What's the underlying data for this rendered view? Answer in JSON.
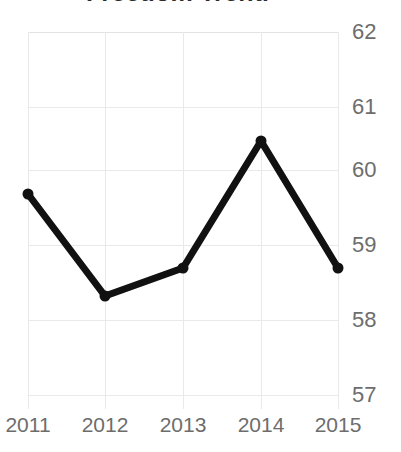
{
  "chart_data": {
    "type": "line",
    "title": "Freedom Trend",
    "xlabel": "",
    "ylabel": "",
    "categories": [
      "2011",
      "2012",
      "2013",
      "2014",
      "2015"
    ],
    "x": [
      2011,
      2012,
      2013,
      2014,
      2015
    ],
    "values": [
      59.68,
      58.32,
      58.69,
      60.39,
      58.69
    ],
    "series": [
      {
        "name": "Freedom",
        "values": [
          59.68,
          58.32,
          58.69,
          60.39,
          58.69
        ]
      }
    ],
    "ylim": [
      57,
      62
    ],
    "yticks": [
      62,
      61,
      60,
      59,
      58,
      57
    ],
    "ytick_labels": [
      "62",
      "61",
      "60",
      "59",
      "58",
      "57"
    ],
    "xticks": [
      "2011",
      "2012",
      "2013",
      "2014",
      "2015"
    ],
    "grid": true,
    "grid_axis": "both",
    "legend": false,
    "legend_position": "none",
    "y_axis_side": "right",
    "markers": true,
    "colors": {
      "line": "#111111",
      "marker": "#111111",
      "grid": "#e9e9e9",
      "tick_label": "#6d6d6d",
      "title": "#2b2b2b",
      "background": "#ffffff"
    }
  },
  "geometry": {
    "plot_left": 28,
    "plot_top": 32,
    "plot_width": 310,
    "plot_height": 363,
    "y_value_top": 62,
    "y_value_bottom": 57,
    "point_px": [
      {
        "x": 28,
        "y": 194
      },
      {
        "x": 105,
        "y": 296
      },
      {
        "x": 183,
        "y": 268
      },
      {
        "x": 261,
        "y": 141
      },
      {
        "x": 338,
        "y": 268
      }
    ],
    "y_tick_px": [
      32,
      107,
      170,
      245,
      320,
      395
    ],
    "x_tick_px": [
      28,
      105,
      183,
      261,
      338
    ]
  }
}
